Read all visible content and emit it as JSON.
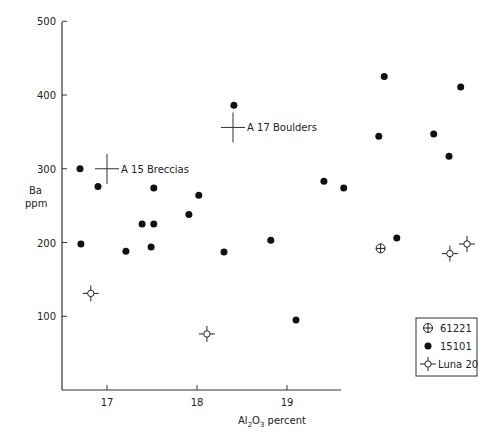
{
  "chart_data": {
    "type": "scatter",
    "title": "",
    "xlabel": "Al2O3 percent",
    "ylabel": "Ba ppm",
    "xlim": [
      16.5,
      21.5
    ],
    "ylim": [
      0,
      500
    ],
    "xticks": [
      17,
      18,
      19
    ],
    "yticks": [
      100,
      200,
      300,
      400,
      500
    ],
    "grid": false,
    "legend_position": "lower right",
    "series": [
      {
        "name": "61221",
        "marker": "circled-plus",
        "points": [
          [
            20.04,
            192
          ]
        ]
      },
      {
        "name": "15101",
        "marker": "filled-circle",
        "points": [
          [
            16.7,
            300
          ],
          [
            16.9,
            276
          ],
          [
            16.71,
            198
          ],
          [
            17.21,
            188
          ],
          [
            17.39,
            225
          ],
          [
            17.52,
            225
          ],
          [
            17.52,
            274
          ],
          [
            17.49,
            194
          ],
          [
            17.91,
            238
          ],
          [
            18.02,
            264
          ],
          [
            18.3,
            187
          ],
          [
            18.41,
            386
          ],
          [
            18.82,
            203
          ],
          [
            19.1,
            95
          ],
          [
            19.41,
            283
          ],
          [
            19.63,
            274
          ],
          [
            20.02,
            344
          ],
          [
            20.08,
            425
          ],
          [
            20.22,
            206
          ],
          [
            20.63,
            347
          ],
          [
            20.8,
            317
          ],
          [
            20.93,
            411
          ]
        ]
      },
      {
        "name": "Luna 20",
        "marker": "open-circle-cross",
        "points": [
          [
            16.82,
            131
          ],
          [
            18.11,
            76
          ],
          [
            20.81,
            185
          ],
          [
            21.0,
            198
          ]
        ]
      }
    ],
    "annotations": [
      {
        "label": "A 15 Breccias",
        "x": 17.0,
        "y": 300,
        "marker": "cross"
      },
      {
        "label": "A 17 Boulders",
        "x": 18.4,
        "y": 356,
        "marker": "cross"
      }
    ]
  },
  "axes": {
    "xlabel_main": "Al",
    "xlabel_sub1": "2",
    "xlabel_mid": "O",
    "xlabel_sub2": "3",
    "xlabel_tail": " percent",
    "ylabel_line1": "Ba",
    "ylabel_line2": "ppm"
  },
  "legend": {
    "items": [
      "61221",
      "15101",
      "Luna 20"
    ]
  }
}
